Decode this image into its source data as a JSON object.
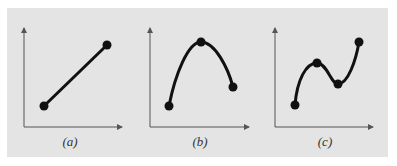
{
  "figure": {
    "background": "#e4e4e4",
    "line_color": "#111111",
    "axis_color": "#555555",
    "panels": [
      {
        "id": "a",
        "label": "(a)",
        "description": "straight line between two points",
        "points": [
          [
            44,
            106
          ],
          [
            107,
            45
          ]
        ]
      },
      {
        "id": "b",
        "label": "(b)",
        "description": "curve through three points (rises to maximum, then falls)",
        "points": [
          [
            169,
            106
          ],
          [
            201,
            42
          ],
          [
            233,
            87
          ]
        ]
      },
      {
        "id": "c",
        "label": "(c)",
        "description": "curve through four points (rise, dip, rise)",
        "points": [
          [
            295,
            105
          ],
          [
            317,
            63
          ],
          [
            338,
            84
          ],
          [
            359,
            42
          ]
        ]
      }
    ]
  }
}
